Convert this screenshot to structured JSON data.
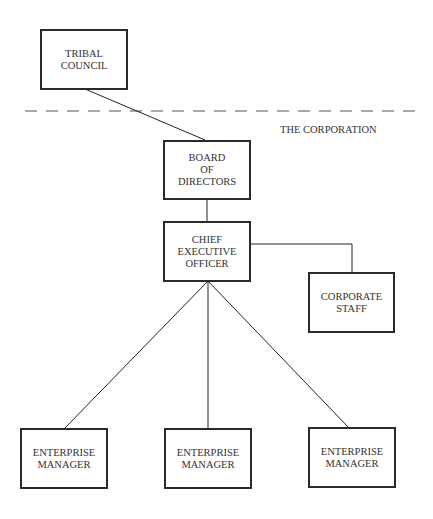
{
  "diagram": {
    "type": "organizational-chart",
    "boundary_label": "THE CORPORATION",
    "nodes": {
      "tribal_council": "TRIBAL\nCOUNCIL",
      "board": "BOARD\nOF\nDIRECTORS",
      "ceo": "CHIEF\nEXECUTIVE\nOFFICER",
      "corporate_staff": "CORPORATE\nSTAFF",
      "enterprise_1": "ENTERPRISE\nMANAGER",
      "enterprise_2": "ENTERPRISE\nMANAGER",
      "enterprise_3": "ENTERPRISE\nMANAGER"
    },
    "edges": [
      [
        "tribal_council",
        "board"
      ],
      [
        "board",
        "ceo"
      ],
      [
        "ceo",
        "corporate_staff"
      ],
      [
        "ceo",
        "enterprise_1"
      ],
      [
        "ceo",
        "enterprise_2"
      ],
      [
        "ceo",
        "enterprise_3"
      ]
    ]
  }
}
